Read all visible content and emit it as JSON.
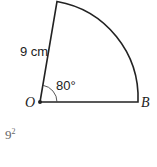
{
  "diagram": {
    "type": "sector",
    "center_label": "O",
    "end_label": "B",
    "radius_label": "9 cm",
    "angle_label": "80°",
    "angle_degrees": 80,
    "stroke_color": "#222222"
  },
  "footer_fragment": {
    "base": "9",
    "exponent": "2"
  }
}
